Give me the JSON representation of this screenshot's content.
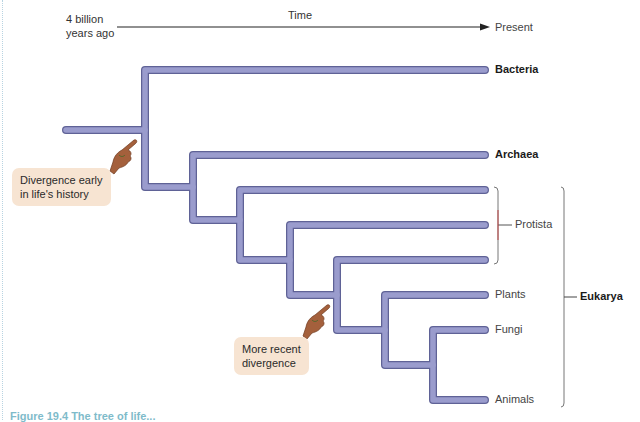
{
  "axis": {
    "start_label_line1": "4 billion",
    "start_label_line2": "years ago",
    "middle_label": "Time",
    "end_label": "Present"
  },
  "leaves": [
    {
      "label": "Bacteria",
      "bold": true
    },
    {
      "label": "Archaea",
      "bold": true
    },
    {
      "label": "",
      "bold": false
    },
    {
      "label": "",
      "bold": false
    },
    {
      "label": "",
      "bold": false
    },
    {
      "label": "Plants",
      "bold": false
    },
    {
      "label": "Fungi",
      "bold": false
    },
    {
      "label": "Animals",
      "bold": false
    }
  ],
  "groups": {
    "protista": "Protista",
    "eukarya": "Eukarya"
  },
  "callouts": {
    "early": {
      "line1": "Divergence early",
      "line2": "in life's history"
    },
    "recent": {
      "line1": "More recent",
      "line2": "divergence"
    }
  },
  "caption": "Figure 19.4 The tree of life...",
  "colors": {
    "branch_fill": "#9a9ccd",
    "branch_stroke": "#5f6296",
    "callout_bg": "#f7e4d2",
    "hand": "#a4603c",
    "bracket": "#777777"
  }
}
